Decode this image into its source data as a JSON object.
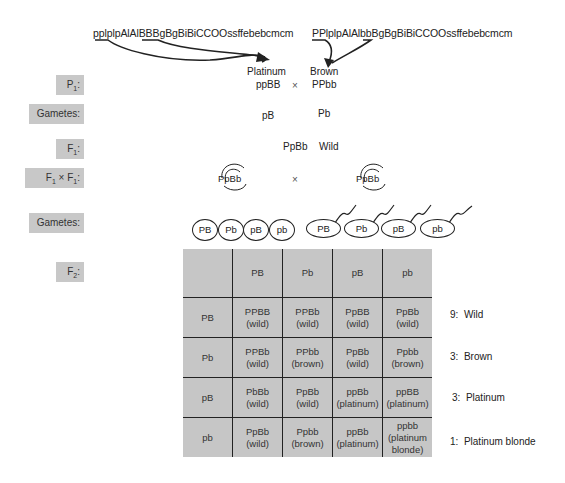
{
  "parents": {
    "left_genotype_full": "pplplpAlAlBBBgBgBiBiCCOOssffebebcmcm",
    "right_genotype_full": "PPlplpAlAlbbBgBgBiBiCCOOssffebebcmcm"
  },
  "stages": {
    "p1": "P",
    "p1_sub": "1",
    "gametes1": "Gametes:",
    "f1": "F",
    "f1_sub": "1",
    "cross_left": "F",
    "cross_left_sub": "1",
    "cross_x": "×",
    "cross_right": "F",
    "cross_right_sub": "1",
    "gametes2": "Gametes:",
    "f2": "F",
    "f2_sub": "2",
    "colon": ":"
  },
  "p1": {
    "left_phenotype": "Platinum",
    "right_phenotype": "Brown",
    "left_genotype": "ppBB",
    "cross": "×",
    "right_genotype": "PPbb"
  },
  "gametes1": {
    "left": "pB",
    "right": "Pb"
  },
  "f1": {
    "genotype": "PpBb",
    "phenotype": "Wild"
  },
  "f1_cross": {
    "left": "PpBb",
    "cross": "×",
    "right": "PpBb"
  },
  "gametes2": {
    "eggs": [
      "PB",
      "Pb",
      "pB",
      "pb"
    ],
    "sperm": [
      "PB",
      "Pb",
      "pB",
      "pb"
    ]
  },
  "punnett": {
    "col_headers": [
      "PB",
      "Pb",
      "pB",
      "pb"
    ],
    "rows": [
      {
        "header": "PB",
        "cells": [
          {
            "g": "PPBB",
            "p": "(wild)"
          },
          {
            "g": "PPBb",
            "p": "(wild)"
          },
          {
            "g": "PpBB",
            "p": "(wild)"
          },
          {
            "g": "PpBb",
            "p": "(wild)"
          }
        ]
      },
      {
        "header": "Pb",
        "cells": [
          {
            "g": "PPBb",
            "p": "(wild)"
          },
          {
            "g": "PPbb",
            "p": "(brown)"
          },
          {
            "g": "PpBb",
            "p": "(wild)"
          },
          {
            "g": "Ppbb",
            "p": "(brown)"
          }
        ]
      },
      {
        "header": "pB",
        "cells": [
          {
            "g": "PbBb",
            "p": "(wild)"
          },
          {
            "g": "PpBb",
            "p": "(wild)"
          },
          {
            "g": "ppBb",
            "p": "(platinum)"
          },
          {
            "g": "ppBB",
            "p": "(platinum)"
          }
        ]
      },
      {
        "header": "pb",
        "cells": [
          {
            "g": "PpBb",
            "p": "(wild)"
          },
          {
            "g": "Ppbb",
            "p": "(brown)"
          },
          {
            "g": "ppBb",
            "p": "(platinum)"
          },
          {
            "g": "ppbb",
            "p": "(platinum",
            "p2": "blonde)"
          }
        ]
      }
    ]
  },
  "ratios": [
    {
      "count": "9:",
      "label": "Wild"
    },
    {
      "count": "3:",
      "label": "Brown"
    },
    {
      "count": "3:",
      "label": "Platinum"
    },
    {
      "count": "1:",
      "label": "Platinum blonde"
    }
  ],
  "colors": {
    "cell_fill": "#c6c6c6",
    "label_fill": "#c8c8c8",
    "ink": "#222222"
  }
}
